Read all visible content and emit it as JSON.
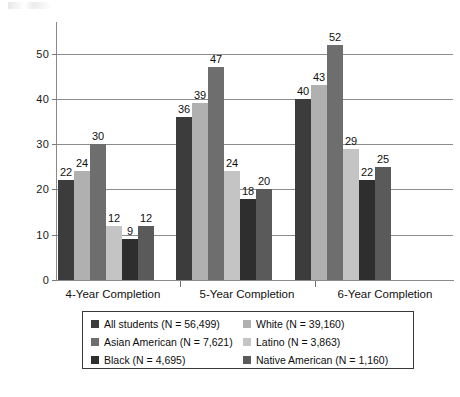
{
  "chart_data": {
    "type": "bar",
    "title": "",
    "subtitle": "",
    "xlabel": "",
    "ylabel": "",
    "categories": [
      "4-Year Completion",
      "5-Year Completion",
      "6-Year Completion"
    ],
    "series": [
      {
        "name": "All students (N = 56,499)",
        "short_name": "All students",
        "n": "56,499",
        "color": "#3c3c3c",
        "values": [
          22,
          24,
          30
        ]
      },
      {
        "name": "White (N = 39,160)",
        "short_name": "White",
        "n": "39,160",
        "color": "#b0b0b0",
        "values": [
          22,
          24,
          30
        ]
      },
      {
        "name": "Asian American (N = 7,621)",
        "short_name": "Asian American",
        "n": "7,621",
        "color": "#6e6e6e",
        "values": [
          22,
          24,
          30
        ]
      },
      {
        "name": "Latino (N = 3,863)",
        "short_name": "Latino",
        "n": "3,863",
        "color": "#c4c4c4",
        "values": [
          22,
          24,
          30
        ]
      },
      {
        "name": "Black (N = 4,695)",
        "short_name": "Black",
        "n": "4,695",
        "color": "#2e2e2e",
        "values": [
          22,
          24,
          30
        ]
      },
      {
        "name": "Native American (N = 1,160)",
        "short_name": "Native American",
        "n": "1,160",
        "color": "#5a5a5a",
        "values": [
          22,
          24,
          30
        ]
      }
    ],
    "groups": [
      {
        "category": "4-Year Completion",
        "values": [
          22,
          24,
          30,
          12,
          9,
          12
        ]
      },
      {
        "category": "5-Year Completion",
        "values": [
          36,
          39,
          47,
          24,
          18,
          20
        ]
      },
      {
        "category": "6-Year Completion",
        "values": [
          40,
          43,
          52,
          29,
          22,
          25
        ]
      }
    ],
    "yticks": [
      0,
      10,
      20,
      30,
      40,
      50
    ],
    "ytick_labels": [
      "0",
      "10",
      "20",
      "30",
      "40",
      "50"
    ],
    "ylim": [
      0,
      57
    ],
    "grid": true,
    "grid_axis": "y",
    "legend_position": "bottom",
    "data_labels": true
  },
  "legend": {
    "items": [
      {
        "label": "All students (N = 56,499)",
        "color": "#3c3c3c"
      },
      {
        "label": "White (N = 39,160)",
        "color": "#b0b0b0"
      },
      {
        "label": "Asian American (N = 7,621)",
        "color": "#6e6e6e"
      },
      {
        "label": "Latino (N = 3,863)",
        "color": "#c4c4c4"
      },
      {
        "label": "Black (N = 4,695)",
        "color": "#2e2e2e"
      },
      {
        "label": "Native American (N = 1,160)",
        "color": "#5a5a5a"
      }
    ]
  },
  "axis": {
    "y_labels": [
      "0",
      "10",
      "20",
      "30",
      "40",
      "50"
    ],
    "x_labels": [
      "4-Year Completion",
      "5-Year Completion",
      "6-Year Completion"
    ]
  },
  "colors": {
    "axis": "#8a8a8a",
    "grid": "#8d8d8d",
    "text": "#111111",
    "legend_border": "#3a3a3a",
    "background": "#ffffff"
  }
}
